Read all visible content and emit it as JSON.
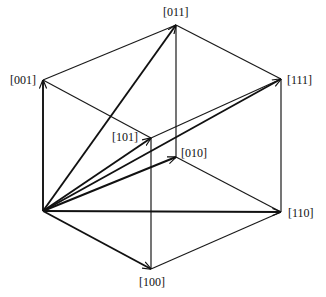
{
  "diagram": {
    "type": "cubic-lattice-directions",
    "origin": {
      "x": 43,
      "y": 211
    },
    "vertices": {
      "001": {
        "x": 43,
        "y": 80
      },
      "011": {
        "x": 176,
        "y": 25
      },
      "111": {
        "x": 281,
        "y": 79
      },
      "110": {
        "x": 281,
        "y": 212
      },
      "100": {
        "x": 151,
        "y": 269
      },
      "101": {
        "x": 151,
        "y": 138
      },
      "010": {
        "x": 176,
        "y": 157
      }
    },
    "labels": {
      "l001": "[001]",
      "l011": "[011]",
      "l111": "[111]",
      "l101": "[101]",
      "l010": "[010]",
      "l110": "[110]",
      "l100": "[100]"
    },
    "vectors_from_origin": [
      "[001]",
      "[011]",
      "[111]",
      "[101]",
      "[010]",
      "[110]",
      "[100]"
    ]
  }
}
